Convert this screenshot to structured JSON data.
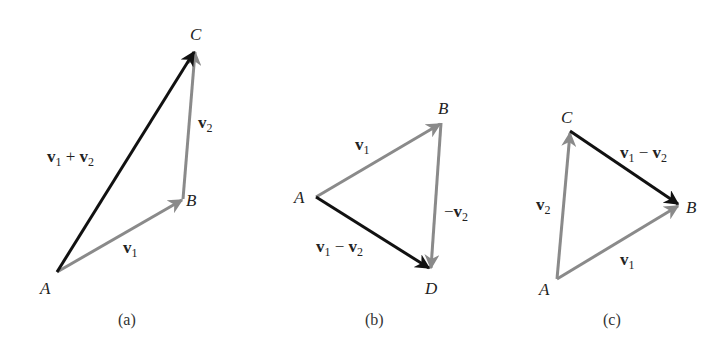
{
  "colors": {
    "gray_vector": "#8a8a8a",
    "black_vector": "#111111",
    "background": "#ffffff"
  },
  "panels": [
    {
      "caption": "(a)",
      "points": {
        "A": [
          57,
          272
        ],
        "B": [
          183,
          199
        ],
        "C": [
          195,
          50
        ]
      },
      "vectors": [
        {
          "from": "A",
          "to": "B",
          "label": "v1",
          "color": "gray"
        },
        {
          "from": "B",
          "to": "C",
          "label": "v2",
          "color": "gray"
        },
        {
          "from": "A",
          "to": "C",
          "label": "v1 + v2",
          "color": "black"
        }
      ]
    },
    {
      "caption": "(b)",
      "points": {
        "A": [
          316,
          197
        ],
        "B": [
          441,
          123
        ],
        "D": [
          431,
          270
        ]
      },
      "vectors": [
        {
          "from": "A",
          "to": "B",
          "label": "v1",
          "color": "gray"
        },
        {
          "from": "B",
          "to": "D",
          "label": "-v2",
          "color": "gray"
        },
        {
          "from": "A",
          "to": "D",
          "label": "v1 - v2",
          "color": "black"
        }
      ]
    },
    {
      "caption": "(c)",
      "points": {
        "A": [
          557,
          279
        ],
        "C": [
          570,
          131
        ],
        "B": [
          680,
          205
        ]
      },
      "vectors": [
        {
          "from": "A",
          "to": "B",
          "label": "v1",
          "color": "gray"
        },
        {
          "from": "A",
          "to": "C",
          "label": "v2",
          "color": "gray"
        },
        {
          "from": "C",
          "to": "B",
          "label": "v1 - v2",
          "color": "black"
        }
      ]
    }
  ],
  "labels": {
    "a": {
      "A": "A",
      "B": "B",
      "C": "C",
      "caption": "(a)"
    },
    "b": {
      "A": "A",
      "B": "B",
      "D": "D",
      "caption": "(b)"
    },
    "c": {
      "A": "A",
      "B": "B",
      "C": "C",
      "caption": "(c)"
    }
  }
}
